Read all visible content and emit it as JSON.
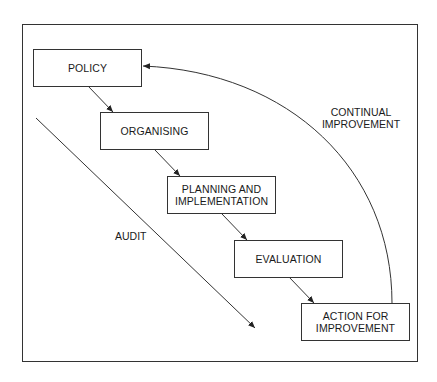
{
  "diagram": {
    "title": "",
    "boxes": [
      {
        "id": "policy",
        "label": "POLICY"
      },
      {
        "id": "organising",
        "label": "ORGANISING"
      },
      {
        "id": "planning",
        "label": "PLANNING AND\nIMPLEMENTATION"
      },
      {
        "id": "evaluation",
        "label": "EVALUATION"
      },
      {
        "id": "action",
        "label": "ACTION FOR\nIMPROVEMENT"
      }
    ],
    "labels": {
      "audit": "AUDIT",
      "continual_improvement": "CONTINUAL\nIMPROVEMENT"
    },
    "edges": [
      {
        "from": "policy",
        "to": "organising"
      },
      {
        "from": "organising",
        "to": "planning"
      },
      {
        "from": "planning",
        "to": "evaluation"
      },
      {
        "from": "evaluation",
        "to": "action"
      },
      {
        "from": "action",
        "to": "policy",
        "label": "CONTINUAL IMPROVEMENT",
        "style": "curved"
      },
      {
        "from": "top-left",
        "to": "bottom-right",
        "label": "AUDIT",
        "style": "diagonal"
      }
    ],
    "colors": {
      "line": "#333333",
      "background": "#ffffff",
      "text": "#1a1a1a"
    }
  }
}
